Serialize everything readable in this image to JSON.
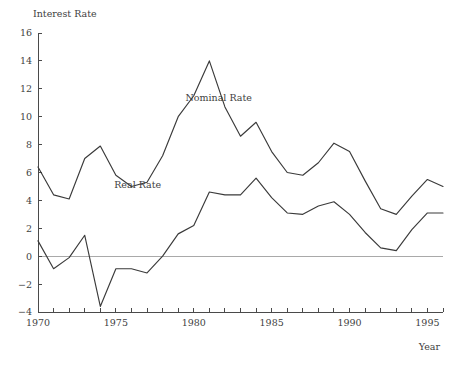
{
  "chart_data": {
    "type": "line",
    "title": "",
    "ylabel": "Interest Rate",
    "xlabel": "Year",
    "xlim": [
      1970,
      1996
    ],
    "ylim": [
      -4,
      16
    ],
    "yticks": [
      -4,
      -2,
      0,
      2,
      4,
      6,
      8,
      10,
      12,
      14,
      16
    ],
    "ytick_labels": [
      "−4",
      "−2",
      "0",
      "2",
      "4",
      "6",
      "8",
      "10",
      "12",
      "14",
      "16"
    ],
    "xticks": [
      1970,
      1971,
      1972,
      1973,
      1974,
      1975,
      1976,
      1977,
      1978,
      1979,
      1980,
      1981,
      1982,
      1983,
      1984,
      1985,
      1986,
      1987,
      1988,
      1989,
      1990,
      1991,
      1992,
      1993,
      1994,
      1995,
      1996
    ],
    "xtick_labels_shown": [
      "1970",
      "1975",
      "1980",
      "1985",
      "1990",
      "1995"
    ],
    "xtick_label_years": [
      1970,
      1975,
      1980,
      1985,
      1990,
      1995
    ],
    "grid": false,
    "legend_position": "inline-annotations",
    "zero_reference_line": 0,
    "x": [
      1970,
      1971,
      1972,
      1973,
      1974,
      1975,
      1976,
      1977,
      1978,
      1979,
      1980,
      1981,
      1982,
      1983,
      1984,
      1985,
      1986,
      1987,
      1988,
      1989,
      1990,
      1991,
      1992,
      1993,
      1994,
      1995,
      1996
    ],
    "series": [
      {
        "name": "Nominal Rate",
        "label": "Nominal Rate",
        "color": "#3a3a3a",
        "label_x": 1981.6,
        "label_y": 11.1,
        "values": [
          6.4,
          4.4,
          4.1,
          7.0,
          7.9,
          5.8,
          5.0,
          5.3,
          7.2,
          10.0,
          11.5,
          14.0,
          10.7,
          8.6,
          9.6,
          7.5,
          6.0,
          5.8,
          6.7,
          8.1,
          7.5,
          5.4,
          3.4,
          3.0,
          4.3,
          5.5,
          5.0
        ]
      },
      {
        "name": "Real Rate",
        "label": "Real Rate",
        "color": "#3a3a3a",
        "label_x": 1976.4,
        "label_y": 4.9,
        "values": [
          1.1,
          -0.9,
          -0.1,
          1.5,
          -3.6,
          -0.9,
          -0.9,
          -1.2,
          0.0,
          1.6,
          2.2,
          4.6,
          4.4,
          4.4,
          5.6,
          4.2,
          3.1,
          3.0,
          3.6,
          3.9,
          3.0,
          1.7,
          0.6,
          0.4,
          1.9,
          3.1,
          3.1
        ]
      }
    ]
  },
  "layout": {
    "plot_left": 38,
    "plot_right": 443,
    "plot_top": 33,
    "plot_bottom": 312,
    "ylabel_x": 33,
    "ylabel_y": 17,
    "xlabel_x": 440,
    "xlabel_y": 350
  }
}
